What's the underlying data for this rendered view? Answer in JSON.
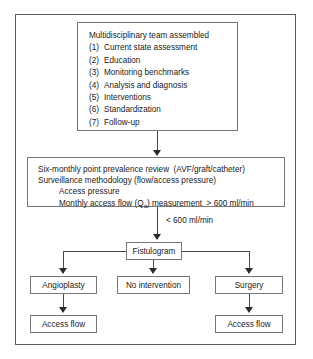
{
  "figure": {
    "boxes": {
      "team": {
        "heading": "Multidisciplinary team assembled",
        "items": [
          {
            "num": "(1)",
            "label": "Current state assessment"
          },
          {
            "num": "(2)",
            "label": "Education"
          },
          {
            "num": "(3)",
            "label": "Monitoring benchmarks"
          },
          {
            "num": "(4)",
            "label": "Analysis and diagnosis"
          },
          {
            "num": "(5)",
            "label": "Interventions"
          },
          {
            "num": "(6)",
            "label": "Standardization"
          },
          {
            "num": "(7)",
            "label": "Follow-up"
          }
        ]
      },
      "surveillance": {
        "line1": "Six-monthly point prevalence review  (AVF/graft/catheter)",
        "line2": "Surveillance methodology (flow/access pressure)",
        "line3": "Access pressure",
        "line4_prefix": "Monthly access flow (Q",
        "line4_sub": "a",
        "line4_suffix": ") measurement  > 600 ml/min"
      },
      "fistulogram": "Fistulogram",
      "angioplasty": "Angioplasty",
      "no_intervention": "No intervention",
      "surgery": "Surgery",
      "access_flow_left": "Access flow",
      "access_flow_right": "Access flow"
    },
    "edge_labels": {
      "threshold": "< 600 ml/min"
    },
    "colors": {
      "box_border": "#777777",
      "frame_border": "#5a5a5a",
      "connector": "#4a4a4a",
      "text": "#1a1a1a",
      "background": "#ffffff"
    }
  }
}
